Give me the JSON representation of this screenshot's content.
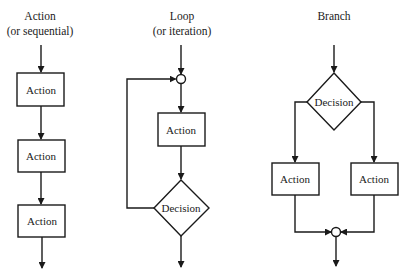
{
  "columns": [
    {
      "id": "sequential",
      "title": "Action",
      "subtitle": "(or sequential)",
      "nodes": [
        {
          "type": "action",
          "label": "Action"
        },
        {
          "type": "action",
          "label": "Action"
        },
        {
          "type": "action",
          "label": "Action"
        }
      ]
    },
    {
      "id": "loop",
      "title": "Loop",
      "subtitle": "(or iteration)",
      "nodes": [
        {
          "type": "junction"
        },
        {
          "type": "action",
          "label": "Action"
        },
        {
          "type": "decision",
          "label": "Decision"
        }
      ]
    },
    {
      "id": "branch",
      "title": "Branch",
      "subtitle": "",
      "nodes": [
        {
          "type": "decision",
          "label": "Decision"
        },
        {
          "type": "action",
          "label": "Action"
        },
        {
          "type": "action",
          "label": "Action"
        },
        {
          "type": "junction"
        }
      ]
    }
  ],
  "colors": {
    "line": "#1a1a1a",
    "background": "#ffffff"
  }
}
